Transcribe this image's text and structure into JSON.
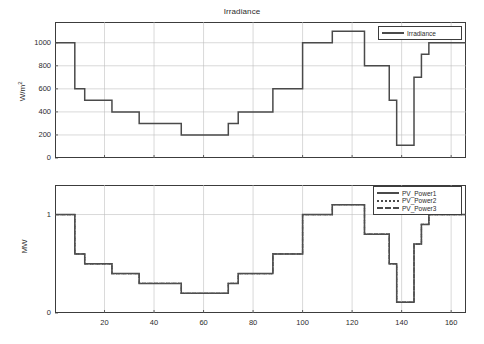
{
  "figure": {
    "background": "#ffffff",
    "line_color": "#4a4a4a",
    "grid_color": "#bfbfbf",
    "axis_color": "#3c3c3c"
  },
  "chart_data": [
    {
      "type": "line",
      "id": "irradiance",
      "title": "Irradiance",
      "xlabel": "",
      "ylabel": "W/m",
      "ylabel_sup": "2",
      "xlim": [
        0,
        166
      ],
      "ylim": [
        0,
        1180
      ],
      "grid": true,
      "legend_position": "upper right",
      "xticks": [
        20,
        40,
        60,
        80,
        100,
        120,
        140,
        160
      ],
      "yticks": [
        0,
        200,
        400,
        600,
        800,
        1000
      ],
      "xtick_labels": [
        "20",
        "40",
        "60",
        "80",
        "100",
        "120",
        "140",
        "160"
      ],
      "ytick_labels": [
        "0",
        "200",
        "400",
        "600",
        "800",
        "1000"
      ],
      "series": [
        {
          "name": "Irradiance",
          "style": "solid",
          "x": [
            0,
            8,
            8,
            12,
            12,
            17,
            17,
            23,
            23,
            28,
            28,
            34,
            34,
            43,
            43,
            51,
            51,
            65,
            65,
            70,
            70,
            74,
            74,
            80,
            80,
            88,
            88,
            92,
            92,
            100,
            100,
            112,
            112,
            125,
            125,
            131,
            131,
            135,
            135,
            138,
            138,
            142,
            142,
            145,
            145,
            148,
            148,
            151,
            151,
            166
          ],
          "y": [
            1000,
            1000,
            600,
            600,
            500,
            500,
            500,
            500,
            400,
            400,
            400,
            400,
            300,
            300,
            300,
            300,
            200,
            200,
            200,
            200,
            300,
            300,
            400,
            400,
            400,
            400,
            600,
            600,
            600,
            600,
            1000,
            1000,
            1100,
            1100,
            800,
            800,
            800,
            800,
            500,
            500,
            110,
            110,
            110,
            110,
            700,
            700,
            900,
            900,
            1000,
            1000,
            1000
          ]
        }
      ]
    },
    {
      "type": "line",
      "id": "pv_power",
      "title": "",
      "xlabel": "",
      "ylabel": "MW",
      "xlim": [
        0,
        166
      ],
      "ylim": [
        0,
        1.3
      ],
      "grid": true,
      "legend_position": "upper right",
      "xticks": [
        20,
        40,
        60,
        80,
        100,
        120,
        140,
        160
      ],
      "yticks": [
        0,
        1
      ],
      "xtick_labels": [
        "20",
        "40",
        "60",
        "80",
        "100",
        "120",
        "140",
        "160"
      ],
      "ytick_labels": [
        "0",
        "1"
      ],
      "series": [
        {
          "name": "PV_Power1",
          "style": "solid",
          "x": [
            0,
            8,
            8,
            12,
            12,
            17,
            17,
            23,
            23,
            28,
            28,
            34,
            34,
            43,
            43,
            51,
            51,
            65,
            65,
            70,
            70,
            74,
            74,
            80,
            80,
            88,
            88,
            92,
            92,
            100,
            100,
            112,
            112,
            125,
            125,
            131,
            131,
            135,
            135,
            138,
            138,
            142,
            142,
            145,
            145,
            148,
            148,
            151,
            151,
            166
          ],
          "y": [
            1.0,
            1.0,
            0.6,
            0.6,
            0.5,
            0.5,
            0.5,
            0.5,
            0.4,
            0.4,
            0.4,
            0.4,
            0.3,
            0.3,
            0.3,
            0.3,
            0.2,
            0.2,
            0.2,
            0.2,
            0.3,
            0.3,
            0.4,
            0.4,
            0.4,
            0.4,
            0.6,
            0.6,
            0.6,
            0.6,
            1.0,
            1.0,
            1.1,
            1.1,
            0.8,
            0.8,
            0.8,
            0.8,
            0.5,
            0.5,
            0.11,
            0.11,
            0.11,
            0.11,
            0.7,
            0.7,
            0.9,
            0.9,
            1.0,
            1.0
          ]
        },
        {
          "name": "PV_Power2",
          "style": "dotted",
          "x": [
            0,
            8,
            8,
            12,
            12,
            17,
            17,
            23,
            23,
            28,
            28,
            34,
            34,
            43,
            43,
            51,
            51,
            65,
            65,
            70,
            70,
            74,
            74,
            80,
            80,
            88,
            88,
            92,
            92,
            100,
            100,
            112,
            112,
            125,
            125,
            131,
            131,
            135,
            135,
            138,
            138,
            142,
            142,
            145,
            145,
            148,
            148,
            151,
            151,
            166
          ],
          "y": [
            1.0,
            1.0,
            0.6,
            0.6,
            0.5,
            0.5,
            0.5,
            0.5,
            0.4,
            0.4,
            0.4,
            0.4,
            0.3,
            0.3,
            0.3,
            0.3,
            0.2,
            0.2,
            0.2,
            0.2,
            0.3,
            0.3,
            0.4,
            0.4,
            0.4,
            0.4,
            0.6,
            0.6,
            0.6,
            0.6,
            1.0,
            1.0,
            1.1,
            1.1,
            0.8,
            0.8,
            0.8,
            0.8,
            0.5,
            0.5,
            0.11,
            0.11,
            0.11,
            0.11,
            0.7,
            0.7,
            0.9,
            0.9,
            1.0,
            1.0
          ]
        },
        {
          "name": "PV_Power3",
          "style": "dashed",
          "x": [
            0,
            8,
            8,
            12,
            12,
            17,
            17,
            23,
            23,
            28,
            28,
            34,
            34,
            43,
            43,
            51,
            51,
            65,
            65,
            70,
            70,
            74,
            74,
            80,
            80,
            88,
            88,
            92,
            92,
            100,
            100,
            112,
            112,
            125,
            125,
            131,
            131,
            135,
            135,
            138,
            138,
            142,
            142,
            145,
            145,
            148,
            148,
            151,
            151,
            166
          ],
          "y": [
            1.0,
            1.0,
            0.6,
            0.6,
            0.5,
            0.5,
            0.5,
            0.5,
            0.4,
            0.4,
            0.4,
            0.4,
            0.3,
            0.3,
            0.3,
            0.3,
            0.2,
            0.2,
            0.2,
            0.2,
            0.3,
            0.3,
            0.4,
            0.4,
            0.4,
            0.4,
            0.6,
            0.6,
            0.6,
            0.6,
            1.0,
            1.0,
            1.1,
            1.1,
            0.8,
            0.8,
            0.8,
            0.8,
            0.5,
            0.5,
            0.11,
            0.11,
            0.11,
            0.11,
            0.7,
            0.7,
            0.9,
            0.9,
            1.0,
            1.0
          ]
        }
      ]
    }
  ]
}
